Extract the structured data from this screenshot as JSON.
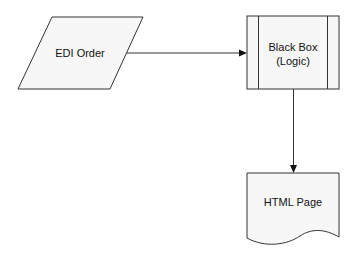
{
  "diagram": {
    "type": "flowchart",
    "nodes": [
      {
        "id": "edi-order",
        "shape": "data (parallelogram)",
        "lines": [
          "EDI Order"
        ]
      },
      {
        "id": "black-box",
        "shape": "predefined process",
        "lines": [
          "Black Box",
          "(Logic)"
        ]
      },
      {
        "id": "html-page",
        "shape": "document",
        "lines": [
          "HTML Page"
        ]
      }
    ],
    "edges": [
      {
        "from": "edi-order",
        "to": "black-box"
      },
      {
        "from": "black-box",
        "to": "html-page"
      }
    ]
  },
  "colors": {
    "shape_fill": "#f7f7f7",
    "stroke": "#333333",
    "text": "#111111"
  }
}
